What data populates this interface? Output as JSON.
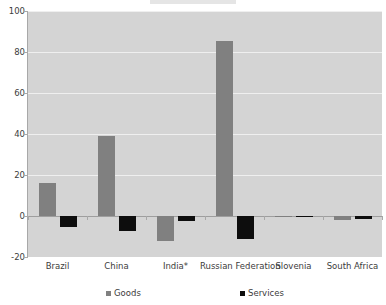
{
  "chart_data": {
    "type": "bar",
    "title": "",
    "xlabel": "",
    "ylabel": "",
    "ylim": [
      -20,
      100
    ],
    "yticks": [
      -20,
      0,
      20,
      40,
      60,
      80,
      100
    ],
    "ytick_labels": [
      "-20",
      "0",
      "20",
      "40",
      "60",
      "80",
      "100"
    ],
    "grid": true,
    "legend_position": "bottom",
    "categories": [
      "Brazil",
      "China",
      "India*",
      "Russian Federation",
      "Slovenia",
      "South Africa"
    ],
    "series": [
      {
        "name": "Goods",
        "color": "#808080",
        "values": [
          16,
          39,
          -12,
          85.5,
          -0.7,
          -2
        ]
      },
      {
        "name": "Services",
        "color": "#0d0d0d",
        "values": [
          -5.5,
          -7.5,
          -2.5,
          -11,
          -0.4,
          -1.5
        ]
      }
    ]
  },
  "axis": {
    "y": {
      "labels": [
        "100",
        "80",
        "60",
        "40",
        "20",
        "0",
        "-20"
      ]
    }
  },
  "legend": {
    "items": [
      {
        "label": "Goods"
      },
      {
        "label": "Services"
      }
    ]
  },
  "colors": {
    "plot_background": "#d4d4d4",
    "gridline": "#efefef",
    "zeroline": "#9e9e9e",
    "axis": "#a8a8a8",
    "goods": "#808080",
    "services": "#0d0d0d",
    "text": "#3c3c3c"
  }
}
